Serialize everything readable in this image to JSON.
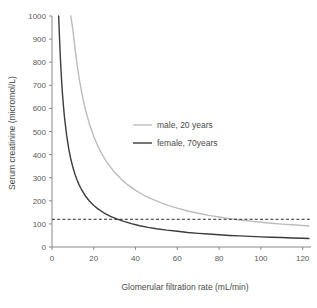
{
  "chart_data": {
    "type": "line",
    "title": "",
    "xlabel": "Glomerular filtration rate (mL/min)",
    "ylabel": "Serum creatinine (micromol/L)",
    "xlim": [
      0,
      124
    ],
    "ylim": [
      0,
      1000
    ],
    "xticks": [
      0,
      20,
      40,
      60,
      80,
      100,
      120
    ],
    "yticks": [
      0,
      100,
      200,
      300,
      400,
      500,
      600,
      700,
      800,
      900,
      1000
    ],
    "xtick_labels": [
      "0",
      "20",
      "40",
      "60",
      "80",
      "100",
      "120"
    ],
    "ytick_labels": [
      "0",
      "100",
      "200",
      "300",
      "400",
      "500",
      "600",
      "700",
      "800",
      "900",
      "1000"
    ],
    "grid": false,
    "legend_position": "center-right",
    "annotations": [
      {
        "name": "reference-line",
        "kind": "horizontal-dashed-line",
        "y": 120,
        "label": "",
        "color": "#2b2b2b"
      }
    ],
    "series": [
      {
        "name": "male, 20 years",
        "color": "#bcbcbc",
        "width": 1.4,
        "x": [
          9,
          10,
          11,
          12,
          13,
          14,
          15,
          16,
          18,
          20,
          22,
          24,
          26,
          28,
          30,
          33,
          36,
          40,
          44,
          48,
          52,
          56,
          60,
          65,
          70,
          75,
          80,
          85,
          90,
          95,
          100,
          105,
          110,
          115,
          120,
          123
        ],
        "y": [
          1000,
          940,
          860,
          790,
          730,
          680,
          635,
          595,
          530,
          478,
          436,
          401,
          371,
          346,
          323,
          295,
          271,
          245,
          224,
          207,
          192,
          179,
          168,
          156,
          146,
          137,
          130,
          123,
          117,
          112,
          107,
          103,
          99,
          96,
          93,
          91
        ]
      },
      {
        "name": "female, 70years",
        "color": "#3c3c3c",
        "width": 1.4,
        "x": [
          3.2,
          3.5,
          4,
          4.5,
          5,
          5.5,
          6,
          7,
          8,
          9,
          10,
          11,
          12,
          13,
          14,
          16,
          18,
          20,
          22,
          25,
          28,
          31,
          34,
          38,
          42,
          46,
          50,
          55,
          60,
          65,
          70,
          75,
          80,
          85,
          90,
          95,
          100,
          105,
          110,
          115,
          120,
          123
        ],
        "y": [
          1000,
          925,
          820,
          735,
          665,
          608,
          560,
          484,
          426,
          381,
          345,
          315,
          290,
          269,
          251,
          221,
          198,
          180,
          165,
          147,
          133,
          122,
          112,
          101,
          92,
          85,
          79,
          73,
          68,
          63,
          59,
          56,
          53,
          50,
          48,
          46,
          44,
          42,
          41,
          39,
          38,
          37
        ]
      }
    ]
  },
  "legend": {
    "items": [
      {
        "label": "male, 20 years",
        "color": "#bcbcbc"
      },
      {
        "label": "female, 70years",
        "color": "#3c3c3c"
      }
    ]
  },
  "axes": {
    "x_title": "Glomerular filtration rate (mL/min)",
    "y_title": "Serum creatinine (micromol/L)"
  }
}
